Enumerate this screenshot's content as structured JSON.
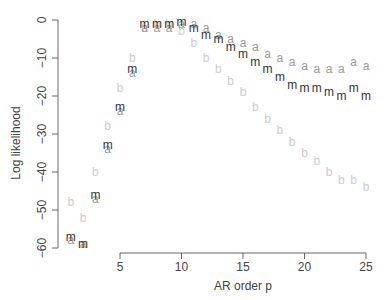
{
  "chart_data": {
    "type": "scatter",
    "title": "",
    "xlabel": "AR order p",
    "ylabel": "Log likelihood",
    "xlim": [
      1,
      25
    ],
    "ylim": [
      -60,
      0
    ],
    "xticks": [
      5,
      10,
      15,
      20,
      25
    ],
    "yticks": [
      0,
      -10,
      -20,
      -30,
      -40,
      -50,
      -60
    ],
    "grid": false,
    "legend": "none (points plotted as letters m, a, b)",
    "x": [
      1,
      2,
      3,
      4,
      5,
      6,
      7,
      8,
      9,
      10,
      11,
      12,
      13,
      14,
      15,
      16,
      17,
      18,
      19,
      20,
      21,
      22,
      23,
      24,
      25
    ],
    "series": [
      {
        "name": "m",
        "marker": "m",
        "color": "#333333",
        "values": [
          -57,
          -59,
          -46,
          -33,
          -23,
          -13,
          -1,
          -1,
          -1,
          -0.5,
          -2,
          -4,
          -5,
          -7,
          -9,
          -11,
          -13,
          -15,
          -17,
          -18,
          -18,
          -19,
          -20,
          -18,
          -20
        ]
      },
      {
        "name": "a",
        "marker": "a",
        "color": "#999999",
        "values": [
          -58,
          -59,
          -47,
          -34,
          -24,
          -14,
          -2,
          -2,
          -2,
          -1,
          -1,
          -2,
          -4,
          -5,
          -6,
          -7,
          -9,
          -10,
          -11,
          -12,
          -13,
          -13,
          -13,
          -11,
          -12
        ]
      },
      {
        "name": "b",
        "marker": "b",
        "color": "#cccccc",
        "values": [
          -48,
          -52,
          -40,
          -28,
          -18,
          -10,
          -2,
          -1,
          -1,
          -3,
          -6,
          -10,
          -13,
          -16,
          -19,
          -23,
          -26,
          -29,
          -32,
          -35,
          -37,
          -40,
          -42,
          -42,
          -44
        ]
      }
    ]
  }
}
